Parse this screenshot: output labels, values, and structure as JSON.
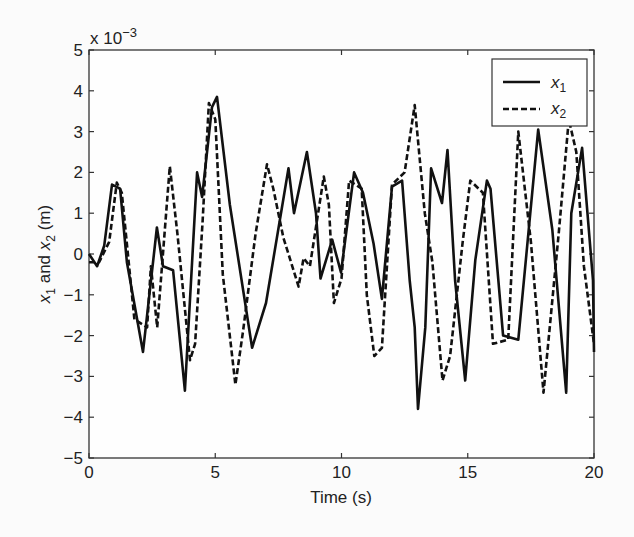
{
  "chart_data": {
    "type": "line",
    "title": "",
    "xlabel": "Time (s)",
    "ylabel_parts": [
      "x",
      "1",
      " and x",
      "2",
      " (m)"
    ],
    "ylabel": "x1 and x2 (m)",
    "y_multiplier": "x 10",
    "y_multiplier_exp": "−3",
    "xlim": [
      0,
      20
    ],
    "ylim": [
      -5,
      5
    ],
    "xticks": [
      0,
      5,
      10,
      15,
      20
    ],
    "xtick_labels": [
      "0",
      "5",
      "10",
      "15",
      "20"
    ],
    "yticks": [
      -5,
      -4,
      -3,
      -2,
      -1,
      0,
      1,
      2,
      3,
      4,
      5
    ],
    "ytick_labels": [
      "−5",
      "−4",
      "−3",
      "−2",
      "−1",
      "0",
      "1",
      "2",
      "3",
      "4",
      "5"
    ],
    "grid": false,
    "legend_position": "upper right",
    "series": [
      {
        "name": "x1",
        "label_base": "x",
        "label_sub": "1",
        "style": "solid",
        "color": "#111111",
        "x": [
          0.0,
          0.32,
          0.6,
          0.91,
          1.23,
          1.5,
          2.14,
          2.69,
          2.93,
          3.33,
          3.8,
          4.28,
          4.48,
          4.87,
          5.07,
          5.58,
          6.46,
          7.01,
          7.9,
          8.12,
          8.63,
          8.99,
          9.17,
          9.63,
          9.98,
          10.5,
          10.85,
          11.27,
          11.6,
          12.0,
          12.4,
          12.7,
          12.9,
          13.03,
          13.32,
          13.55,
          13.98,
          14.2,
          14.5,
          14.9,
          15.3,
          15.76,
          15.9,
          16.4,
          17.0,
          17.79,
          18.35,
          18.9,
          19.1,
          19.53,
          19.96,
          20.0
        ],
        "y": [
          0.0,
          -0.3,
          0.2,
          1.7,
          1.6,
          -0.2,
          -2.4,
          0.65,
          -0.3,
          -0.4,
          -3.35,
          2.0,
          1.4,
          3.6,
          3.85,
          1.2,
          -2.3,
          -1.2,
          2.1,
          1.0,
          2.5,
          1.0,
          -0.6,
          0.35,
          -0.45,
          2.0,
          1.5,
          0.25,
          -1.1,
          1.65,
          1.8,
          -0.65,
          -1.8,
          -3.8,
          -1.8,
          2.1,
          1.25,
          2.55,
          -0.65,
          -3.1,
          -0.15,
          1.8,
          1.6,
          -2.0,
          -2.1,
          3.05,
          0.6,
          -3.4,
          1.0,
          2.6,
          -0.65,
          -2.4
        ],
        "ylim": [
          -5,
          5
        ]
      },
      {
        "name": "x2",
        "label_base": "x",
        "label_sub": "2",
        "style": "dashed",
        "color": "#111111",
        "x": [
          0.0,
          0.4,
          0.8,
          1.1,
          1.3,
          1.8,
          2.3,
          2.45,
          2.7,
          3.2,
          3.5,
          4.0,
          4.2,
          4.5,
          4.75,
          5.0,
          5.3,
          5.8,
          6.1,
          6.6,
          7.05,
          7.3,
          7.7,
          8.3,
          8.5,
          8.75,
          9.3,
          9.5,
          9.7,
          10.0,
          10.3,
          10.8,
          11.0,
          11.3,
          11.6,
          12.0,
          12.5,
          12.9,
          13.3,
          13.6,
          14.0,
          14.3,
          14.8,
          15.1,
          15.6,
          16.0,
          16.6,
          17.0,
          17.5,
          18.0,
          18.6,
          19.0,
          19.3,
          19.6,
          20.0
        ],
        "y": [
          -0.2,
          -0.2,
          0.3,
          1.75,
          1.5,
          -1.6,
          -1.8,
          -0.3,
          -1.8,
          2.15,
          0.5,
          -2.6,
          -2.2,
          0.8,
          3.7,
          3.3,
          -0.5,
          -3.2,
          -1.9,
          0.5,
          2.2,
          1.6,
          0.4,
          -0.8,
          -0.1,
          -0.3,
          1.9,
          1.2,
          -1.2,
          -0.6,
          1.8,
          1.6,
          -1.0,
          -2.5,
          -2.3,
          1.7,
          2.0,
          3.65,
          1.0,
          -0.2,
          -3.1,
          -2.5,
          0.3,
          1.8,
          1.5,
          -2.2,
          -2.1,
          3.0,
          0.3,
          -3.4,
          0.5,
          3.3,
          2.5,
          -0.3,
          -2.2
        ],
        "ylim": [
          -5,
          5
        ]
      }
    ]
  }
}
